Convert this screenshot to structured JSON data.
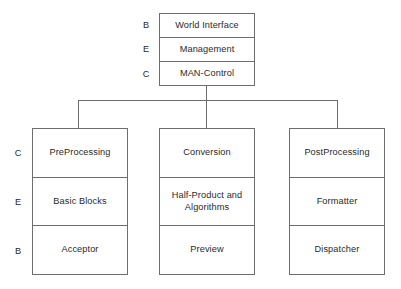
{
  "diagram": {
    "colors": {
      "line": "#6d6d6d",
      "text": "#2a2a2a",
      "background": "#ffffff"
    },
    "tier_legend": {
      "top_labels": [
        "B",
        "E",
        "C"
      ],
      "bottom_labels": [
        "C",
        "E",
        "B"
      ]
    },
    "root": {
      "name": "MAN-Control stack",
      "tiers": [
        {
          "letter": "B",
          "label": "World Interface"
        },
        {
          "letter": "E",
          "label": "Management"
        },
        {
          "letter": "C",
          "label": "MAN-Control"
        }
      ]
    },
    "children": [
      {
        "name": "preprocessing-stack",
        "tiers": [
          {
            "letter": "C",
            "label": "PreProcessing"
          },
          {
            "letter": "E",
            "label": "Basic Blocks"
          },
          {
            "letter": "B",
            "label": "Acceptor"
          }
        ]
      },
      {
        "name": "conversion-stack",
        "tiers": [
          {
            "letter": "C",
            "label": "Conversion"
          },
          {
            "letter": "E",
            "label": "Half-Product and\nAlgorithms"
          },
          {
            "letter": "B",
            "label": "Preview"
          }
        ]
      },
      {
        "name": "postprocessing-stack",
        "tiers": [
          {
            "letter": "C",
            "label": "PostProcessing"
          },
          {
            "letter": "E",
            "label": "Formatter"
          },
          {
            "letter": "B",
            "label": "Dispatcher"
          }
        ]
      }
    ]
  }
}
